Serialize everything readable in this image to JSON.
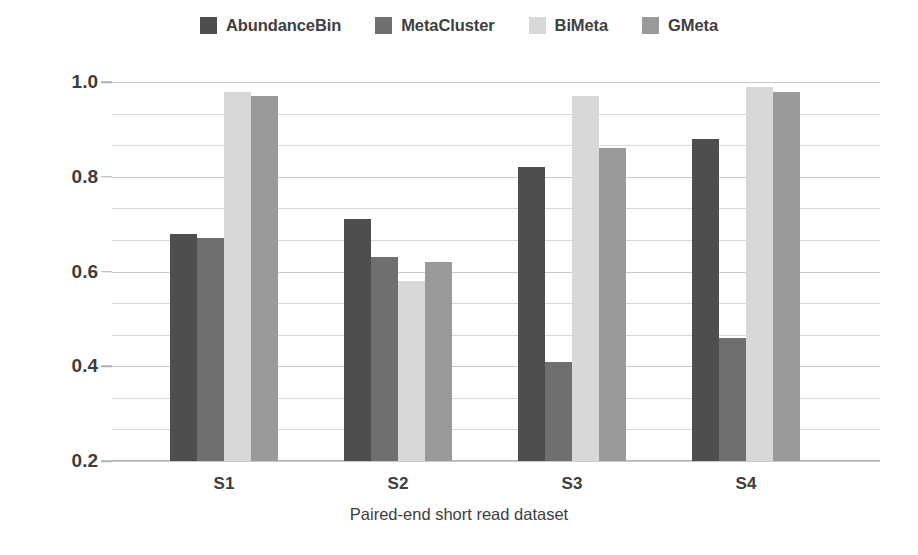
{
  "chart_data": {
    "type": "bar",
    "title": "",
    "xlabel": "Paired-end short read dataset",
    "ylabel": "F-measure",
    "categories": [
      "S1",
      "S2",
      "S3",
      "S4"
    ],
    "ylim": [
      0.2,
      1.0
    ],
    "yticks": [
      0.2,
      0.4,
      0.6,
      0.8,
      1.0
    ],
    "ytick_labels": [
      "0.2",
      "0.4",
      "0.6",
      "0.8",
      "1.0"
    ],
    "minor_gridlines_per_major": 3,
    "grid": true,
    "legend_position": "top-center",
    "series": [
      {
        "name": "AbundanceBin",
        "color": "#4e4e4e",
        "values": [
          0.68,
          0.71,
          0.82,
          0.88
        ]
      },
      {
        "name": "MetaCluster",
        "color": "#6f6f6f",
        "values": [
          0.67,
          0.63,
          0.41,
          0.46
        ]
      },
      {
        "name": "BiMeta",
        "color": "#d8d8d8",
        "values": [
          0.98,
          0.58,
          0.97,
          0.99
        ]
      },
      {
        "name": "GMeta",
        "color": "#9a9a9a",
        "values": [
          0.97,
          0.62,
          0.86,
          0.98
        ]
      }
    ]
  },
  "legend": {
    "items": [
      {
        "label": "AbundanceBin",
        "color": "#4e4e4e"
      },
      {
        "label": "MetaCluster",
        "color": "#6f6f6f"
      },
      {
        "label": "BiMeta",
        "color": "#d8d8d8"
      },
      {
        "label": "GMeta",
        "color": "#9a9a9a"
      }
    ]
  },
  "axes": {
    "x_title": "Paired-end short read dataset",
    "y_title": "F-measure",
    "x_tick_labels": [
      "S1",
      "S2",
      "S3",
      "S4"
    ],
    "y_tick_labels": [
      "1.0",
      "0.8",
      "0.6",
      "0.4",
      "0.2"
    ]
  }
}
